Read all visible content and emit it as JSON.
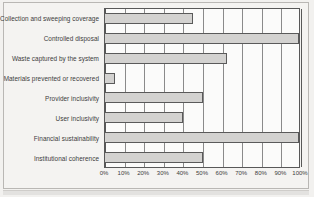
{
  "chart_data": {
    "type": "bar",
    "orientation": "horizontal",
    "title": "",
    "xlabel": "",
    "ylabel": "",
    "xlim": [
      0,
      100
    ],
    "grid": true,
    "legend": "none",
    "tick_suffix": "%",
    "categories": [
      "Collection and sweeping coverage",
      "Controlled disposal",
      "Waste captured by the system",
      "Materials prevented or recovered",
      "Provider inclusivity",
      "User inclusivity",
      "Financial sustainability",
      "Institutional coherence"
    ],
    "values": [
      45,
      100,
      62,
      5,
      50,
      40,
      100,
      50
    ],
    "xticks": [
      0,
      10,
      20,
      30,
      40,
      50,
      60,
      70,
      80,
      90,
      100
    ],
    "xtick_labels": [
      "0%",
      "10%",
      "20%",
      "30%",
      "40%",
      "50%",
      "60%",
      "70%",
      "80%",
      "90%",
      "100%"
    ],
    "colors": {
      "bar_fill": "#d3d2d0",
      "bar_stroke": "#5a5a5a",
      "gridline": "#8a8a8a",
      "axis": "#585858",
      "plot_background": "#fbfbfa",
      "page_background": "#f4f3f1",
      "text": "#3c3c3c"
    }
  }
}
